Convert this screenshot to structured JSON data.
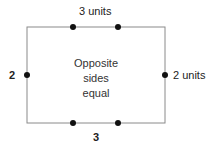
{
  "diagram": {
    "colors": {
      "line": "#8a8a8a",
      "dot": "#111111",
      "text": "#222222"
    },
    "labels": {
      "top": "3 units",
      "bottom": "3",
      "left": "2",
      "right": "2 units"
    },
    "center_text": [
      "Opposite",
      "sides",
      "equal"
    ]
  }
}
